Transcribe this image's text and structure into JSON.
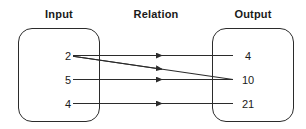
{
  "diagram": {
    "type": "mapping-diagram",
    "headings": {
      "input": "Input",
      "relation": "Relation",
      "output": "Output"
    },
    "input_set": {
      "label": "Input",
      "elements": [
        "2",
        "5",
        "4"
      ]
    },
    "output_set": {
      "label": "Output",
      "elements": [
        "4",
        "10",
        "21"
      ]
    },
    "mappings": [
      {
        "from": "2",
        "to": "4",
        "style": "horizontal"
      },
      {
        "from": "2",
        "to": "10",
        "style": "diagonal"
      },
      {
        "from": "5",
        "to": "10",
        "style": "horizontal"
      },
      {
        "from": "4",
        "to": "21",
        "style": "horizontal"
      }
    ],
    "colors": {
      "stroke": "#2b2b2b",
      "text": "#1a1a1a",
      "background": "#ffffff"
    }
  }
}
